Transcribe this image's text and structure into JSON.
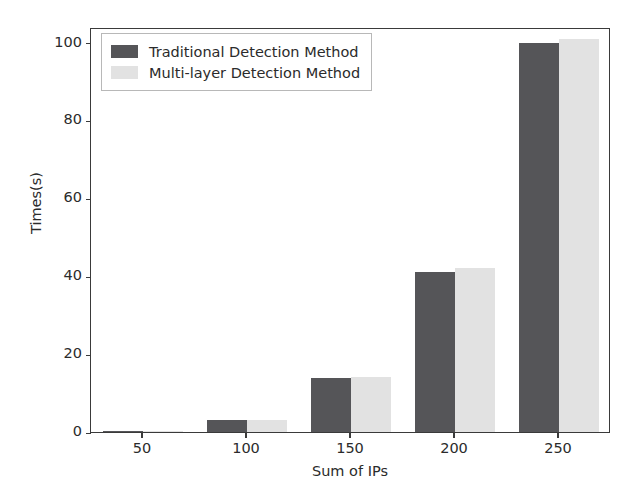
{
  "chart_data": {
    "type": "bar",
    "title": "",
    "xlabel": "Sum of IPs",
    "ylabel": "Times(s)",
    "categories": [
      "50",
      "100",
      "150",
      "200",
      "250"
    ],
    "series": [
      {
        "name": "Traditional Detection Method",
        "color": "#555558",
        "values": [
          0.2,
          3.0,
          13.8,
          41.0,
          100.0
        ]
      },
      {
        "name": "Multi-layer Detection Method",
        "color": "#e2e2e2",
        "values": [
          0.2,
          3.0,
          14.0,
          42.0,
          101.0
        ]
      }
    ],
    "xlim": [
      25,
      275
    ],
    "ylim": [
      0,
      104
    ],
    "yticks": [
      0,
      20,
      40,
      60,
      80,
      100
    ],
    "ytick_labels": [
      "0",
      "20",
      "40",
      "60",
      "80",
      "100"
    ],
    "xticks": [
      50,
      100,
      150,
      200,
      250
    ],
    "xtick_labels": [
      "50",
      "100",
      "150",
      "200",
      "250"
    ],
    "grid": false,
    "legend_position": "upper left"
  }
}
